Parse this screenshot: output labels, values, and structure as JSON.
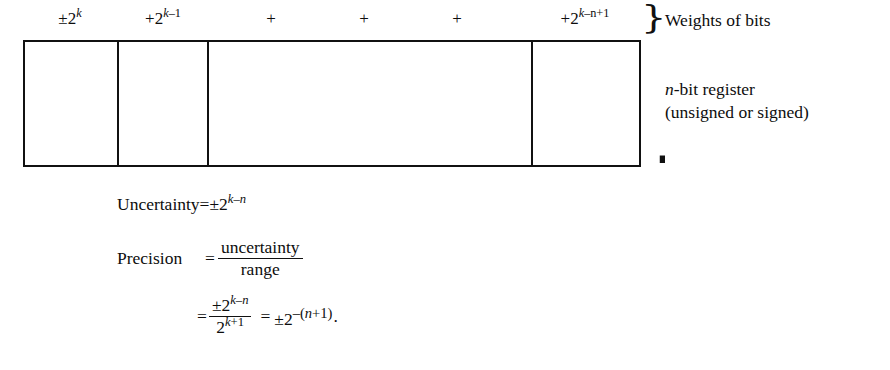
{
  "diagram": {
    "background_color": "#ffffff",
    "line_color": "#111111",
    "weights": [
      {
        "id": "msb",
        "text": "±2ᵏ",
        "plain": "±2^k",
        "x_center": 70,
        "kind": "power"
      },
      {
        "id": "msb-minus-1",
        "text": "+2ᵏ⁻¹",
        "plain": "+2^(k-1)",
        "x_center": 163,
        "kind": "power"
      },
      {
        "id": "plus-1",
        "text": "+",
        "plain": "+",
        "x_center": 271,
        "kind": "plus"
      },
      {
        "id": "plus-2",
        "text": "+",
        "plain": "+",
        "x_center": 364,
        "kind": "plus"
      },
      {
        "id": "plus-3",
        "text": "+",
        "plain": "+",
        "x_center": 457,
        "kind": "plus"
      },
      {
        "id": "lsb",
        "text": "+2ᵏ⁻ⁿ⁺¹",
        "plain": "+2^(k-n+1)",
        "x_center": 585,
        "kind": "power"
      }
    ],
    "weight_parts": {
      "msb": {
        "base": "±2",
        "exp_main": "k"
      },
      "msb_minus_1": {
        "base": "+2",
        "exp_main": "k",
        "exp_tail": "–1"
      },
      "lsb": {
        "base": "+2",
        "exp_main": "k",
        "exp_tail": "–n",
        "exp_tail2": "+1"
      }
    },
    "register": {
      "left": 23,
      "top": 40,
      "width": 618,
      "height": 127,
      "divider_x": [
        117,
        207,
        531
      ],
      "cell_count": 4
    },
    "braces": {
      "weights_brace": "}",
      "register_brace": "}"
    },
    "captions": {
      "weights": "Weights of bits",
      "register_line1_var": "n",
      "register_line1_rest": "-bit register",
      "register_line2": "(unsigned or signed)"
    },
    "equations": {
      "uncertainty": {
        "label": "Uncertainty",
        "equals": "=",
        "value_base": "±2",
        "value_exp_var": "k",
        "value_exp_tail": "–n",
        "plain": "Uncertainty = ±2^(k-n)"
      },
      "precision": {
        "label": "Precision",
        "equals": "=",
        "numerator": "uncertainty",
        "denominator": "range",
        "plain": "Precision = uncertainty / range"
      },
      "final": {
        "equals1": "=",
        "numerator_base": "±2",
        "numerator_exp_var": "k",
        "numerator_exp_tail": "–n",
        "denominator_base": "2",
        "denominator_exp_var": "k",
        "denominator_exp_tail": "+1",
        "equals2": "=",
        "result_base": "±2",
        "result_exp_sign": "–(",
        "result_exp_var": "n",
        "result_exp_tail": "+1)",
        "period": ".",
        "plain": "= ±2^(k-n) / 2^(k+1) = ±2^-(n+1)."
      }
    }
  }
}
